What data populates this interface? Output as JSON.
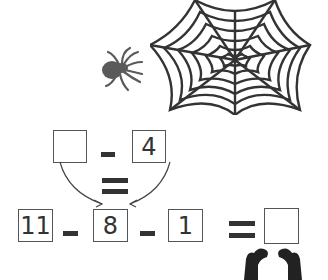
{
  "illustrations": {
    "spider": "spider-icon",
    "web": "spider-web-icon",
    "hands": "hands-icon"
  },
  "colors": {
    "spider": "#5a5a5a",
    "web": "#333333",
    "box_border": "#555555",
    "text": "#333333"
  },
  "top_equation": {
    "left_box": "",
    "operator": "-",
    "right_box": "4",
    "equals": "="
  },
  "bottom_equation": {
    "box1": "11",
    "op1": "-",
    "box2": "8",
    "op2": "-",
    "box3": "1",
    "equals": "=",
    "answer": ""
  }
}
